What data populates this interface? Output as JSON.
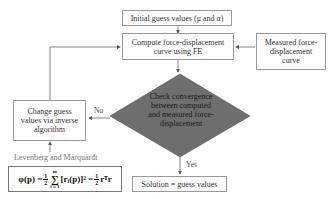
{
  "diagram": {
    "boxes": {
      "initial": "Initial guess values (μ and α)",
      "compute_line1": "Compute force-displacement",
      "compute_line2": "curve using FE",
      "measured_line1": "Measured force-",
      "measured_line2": "displacement",
      "measured_line3": "curve",
      "change_line1": "Change guess",
      "change_line2": "values via inverse",
      "change_line3": "algorithm",
      "solution": "Solution = guess values"
    },
    "decision": {
      "line1": "Check convergence",
      "line2": "between computed",
      "line3": "and measured force-",
      "line4": "displacement",
      "fill": "#6e6e6e"
    },
    "edge_labels": {
      "no": "No",
      "yes": "Yes"
    },
    "algorithm_label": "Levenberg and Marquardt",
    "formula": {
      "lhs": "φ(p) =",
      "half_num": "1",
      "half_den": "2",
      "sum_top": "m",
      "sum_sym": "∑",
      "sum_bottom": "i = 1",
      "term": "[rᵢ(p)]² =",
      "half2_num": "1",
      "half2_den": "2",
      "rhs": "rᵀr"
    }
  }
}
